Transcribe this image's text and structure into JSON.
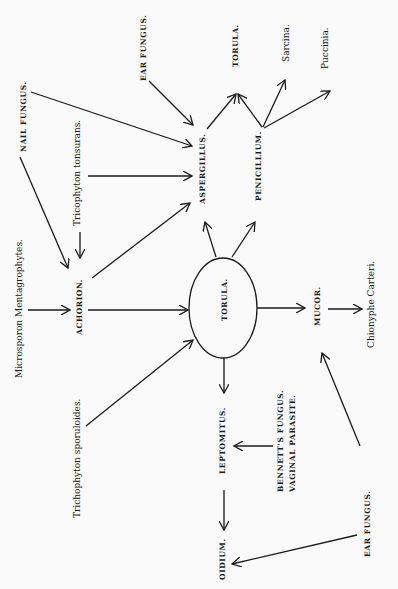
{
  "diagram": {
    "center_node": "TORULA.",
    "nodes": {
      "ear_fungus_top": "EAR FUNGUS.",
      "nail_fungus": "NAIL FUNGUS.",
      "tricophyton_tonsurans": "Tricophyton tonsurans.",
      "microsporon": "Microsporon Mentagrophytes.",
      "achorion": "ACHORION.",
      "trichophyton_sporuloides": "Trichophyton sporuloides.",
      "aspergillus": "ASPERGILLUS.",
      "penicillium": "PENICILLIUM.",
      "torula_top": "TORULA.",
      "sarcina": "Sarcina.",
      "puccinia": "Puccinia.",
      "mucor": "MUCOR.",
      "chionyphe": "Chionyphe Carteri.",
      "leptomitus": "LEPTOMITUS.",
      "bennett_1": "BENNETT'S FUNGUS.",
      "bennett_2": "VAGINAL PARASITE.",
      "oidium": "OIDIUM.",
      "ear_fungus_bottom": "EAR FUNGUS."
    },
    "edges": [
      [
        "EAR FUNGUS.",
        "ASPERGILLUS."
      ],
      [
        "NAIL FUNGUS.",
        "ASPERGILLUS."
      ],
      [
        "NAIL FUNGUS.",
        "ACHORION."
      ],
      [
        "Tricophyton tonsurans.",
        "ASPERGILLUS."
      ],
      [
        "Tricophyton tonsurans.",
        "ACHORION."
      ],
      [
        "Microsporon Mentagrophytes.",
        "ACHORION."
      ],
      [
        "ACHORION.",
        "ASPERGILLUS."
      ],
      [
        "ACHORION.",
        "TORULA."
      ],
      [
        "Trichophyton sporuloides.",
        "TORULA."
      ],
      [
        "TORULA.",
        "ASPERGILLUS."
      ],
      [
        "TORULA.",
        "PENICILLIUM."
      ],
      [
        "TORULA.",
        "MUCOR."
      ],
      [
        "TORULA.",
        "LEPTOMITUS."
      ],
      [
        "ASPERGILLUS.",
        "TORULA. (top)"
      ],
      [
        "PENICILLIUM.",
        "TORULA. (top)"
      ],
      [
        "PENICILLIUM.",
        "Sarcina."
      ],
      [
        "PENICILLIUM.",
        "Puccinia."
      ],
      [
        "MUCOR.",
        "Chionyphe Carteri."
      ],
      [
        "EAR FUNGUS. (bottom)",
        "MUCOR."
      ],
      [
        "EAR FUNGUS. (bottom)",
        "OIDIUM."
      ],
      [
        "BENNETT'S FUNGUS.",
        "LEPTOMITUS."
      ],
      [
        "LEPTOMITUS.",
        "OIDIUM."
      ]
    ]
  }
}
